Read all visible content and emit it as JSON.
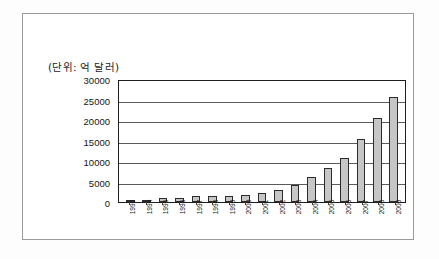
{
  "document": {
    "frame_visible": true,
    "background_color": "#ffffff",
    "border_color": "#9a9a9a"
  },
  "chart_data": {
    "type": "bar",
    "title": "",
    "unit_caption": "(단위: 억 달러)",
    "xlabel": "",
    "ylabel": "",
    "ylim": [
      0,
      30000
    ],
    "ytick_values": [
      30000,
      25000,
      20000,
      15000,
      10000,
      5000,
      0
    ],
    "ytick_labels": [
      "30000",
      "25000",
      "20000",
      "15000",
      "10000",
      "5000",
      "0"
    ],
    "grid": true,
    "grid_orientation": "horizontal",
    "legend": false,
    "legend_position": "none",
    "bar_fill_color": "#c6c6c6",
    "bar_border_color": "#2b2b2b",
    "categories": [
      "1993",
      "1994",
      "1995",
      "1996",
      "1997",
      "1998",
      "1999",
      "2000",
      "2001",
      "2002",
      "2003",
      "2004",
      "2005",
      "2006",
      "2007",
      "2008",
      "2009"
    ],
    "values": [
      210,
      520,
      870,
      1040,
      1430,
      1450,
      1550,
      1660,
      2100,
      2860,
      4030,
      6100,
      8200,
      10700,
      15300,
      20500,
      25500
    ],
    "series": [
      {
        "name": "외환보유액",
        "values": [
          210,
          520,
          870,
          1040,
          1430,
          1450,
          1550,
          1660,
          2100,
          2860,
          4030,
          6100,
          8200,
          10700,
          15300,
          20500,
          25500
        ]
      }
    ]
  }
}
